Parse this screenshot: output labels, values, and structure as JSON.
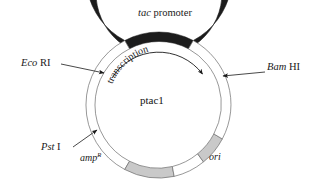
{
  "figure": {
    "name": "plasmid-map",
    "center_label": "ptac1",
    "width": 317,
    "height": 185,
    "background": "#ffffff"
  },
  "labels": {
    "tac_promoter": {
      "italic_part": "tac",
      "roman_part": " promoter"
    },
    "eco_ri": {
      "italic_part": "Eco",
      "roman_part": " RI"
    },
    "bam_hi": {
      "italic_part": "Bam",
      "roman_part": " HI"
    },
    "pst_i": {
      "italic_part": "Pst",
      "roman_part": " I"
    },
    "amp_resistance": {
      "base": "amp",
      "superscript": "R"
    },
    "ori": "ori",
    "transcription": "transcription"
  },
  "segments": [
    {
      "name": "tac-promoter-arc",
      "fill": "#1c1c1c",
      "start_deg": -118,
      "end_deg": 62
    },
    {
      "name": "eco-ri-to-pst-white-arc",
      "fill": "#ffffff",
      "start_deg": -118,
      "end_deg": -62
    },
    {
      "name": "amp-resistance-arc",
      "fill": "#c9c9c9",
      "start_deg": -62,
      "end_deg": 12
    },
    {
      "name": "white-gap-bottom-arc",
      "fill": "#ffffff",
      "start_deg": 12,
      "end_deg": 45
    },
    {
      "name": "ori-arc",
      "fill": "#c9c9c9",
      "start_deg": 45,
      "end_deg": 75
    },
    {
      "name": "bam-hi-white-arc",
      "fill": "#ffffff",
      "start_deg": 75,
      "end_deg": 118
    }
  ],
  "colors": {
    "promoter_dark": "#1c1c1c",
    "gene_gray": "#c9c9c9",
    "outline": "#555555",
    "text": "#1a1a1a",
    "leader_line": "#3a3a3a"
  },
  "geometry": {
    "center_x": 159,
    "center_y": 105,
    "outer_radius": 73,
    "inner_radius": 63,
    "transcription_arc_radius": 55
  }
}
